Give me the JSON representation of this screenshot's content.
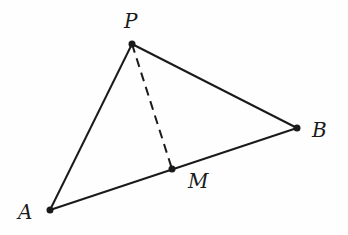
{
  "diagram": {
    "type": "geometry-triangle",
    "colors": {
      "stroke": "#1a1a1a",
      "background": "#fefefe"
    },
    "points": {
      "P": {
        "label": "P",
        "x": 132,
        "y": 44
      },
      "B": {
        "label": "B",
        "x": 297,
        "y": 128
      },
      "M": {
        "label": "M",
        "x": 172,
        "y": 169
      },
      "A": {
        "label": "A",
        "x": 50,
        "y": 210
      }
    },
    "segments": [
      {
        "from": "P",
        "to": "A",
        "style": "solid"
      },
      {
        "from": "P",
        "to": "B",
        "style": "solid"
      },
      {
        "from": "A",
        "to": "B",
        "style": "solid"
      },
      {
        "from": "P",
        "to": "M",
        "style": "dashed"
      }
    ]
  }
}
